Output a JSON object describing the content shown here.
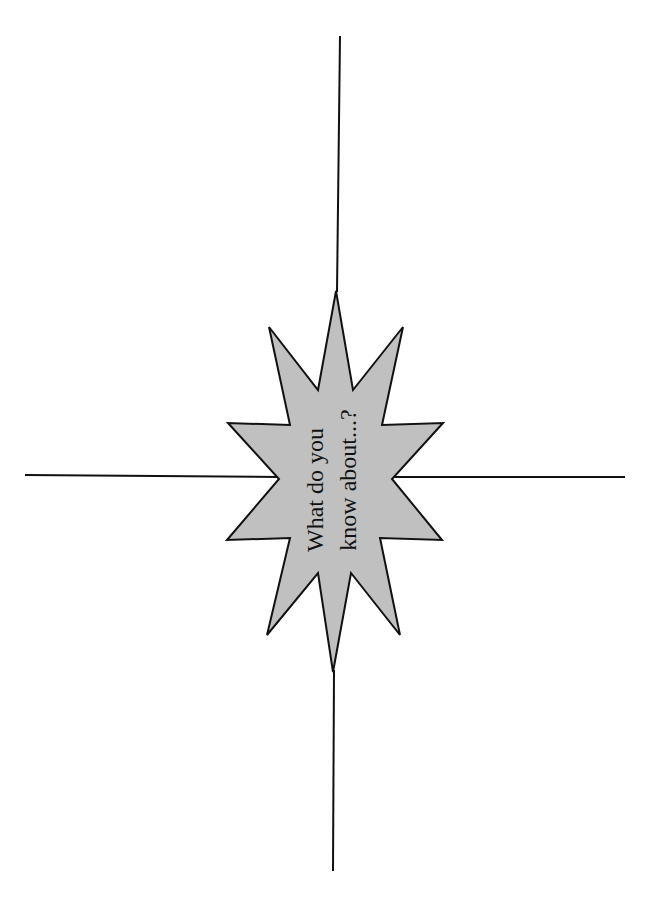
{
  "diagram": {
    "type": "brainstorm-starburst",
    "center_shape": {
      "kind": "12-point starburst",
      "fill": "#c0c0c0",
      "stroke": "#111111",
      "text_lines": [
        "What do you",
        "know about...?"
      ],
      "text_orientation": "rotated -90deg (reads bottom to top)"
    },
    "lines": {
      "color": "#111111",
      "count": 4,
      "directions": [
        "up",
        "down",
        "left",
        "right"
      ]
    }
  }
}
